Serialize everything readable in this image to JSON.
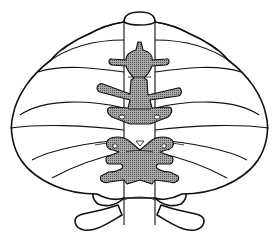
{
  "figure": {
    "type": "anatomical line drawing",
    "labels": []
  },
  "colors": {
    "outline": "#111111",
    "fill": "#ffffff",
    "shade": "#8a8a8a"
  }
}
